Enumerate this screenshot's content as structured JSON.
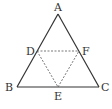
{
  "diagram": {
    "title": "",
    "colors": {
      "solid": "#333333",
      "dashed": "#555555",
      "background": "#ffffff"
    },
    "points": {
      "A": {
        "label": "A",
        "x": 58,
        "y": 14
      },
      "B": {
        "label": "B",
        "x": 17,
        "y": 87
      },
      "C": {
        "label": "C",
        "x": 99,
        "y": 87
      },
      "D": {
        "label": "D",
        "x": 37,
        "y": 51
      },
      "E": {
        "label": "E",
        "x": 58,
        "y": 87
      },
      "F": {
        "label": "F",
        "x": 79,
        "y": 51
      }
    },
    "solid_segments": [
      "AB",
      "BC",
      "CA"
    ],
    "dashed_segments": [
      "DF",
      "DE",
      "EF"
    ]
  }
}
